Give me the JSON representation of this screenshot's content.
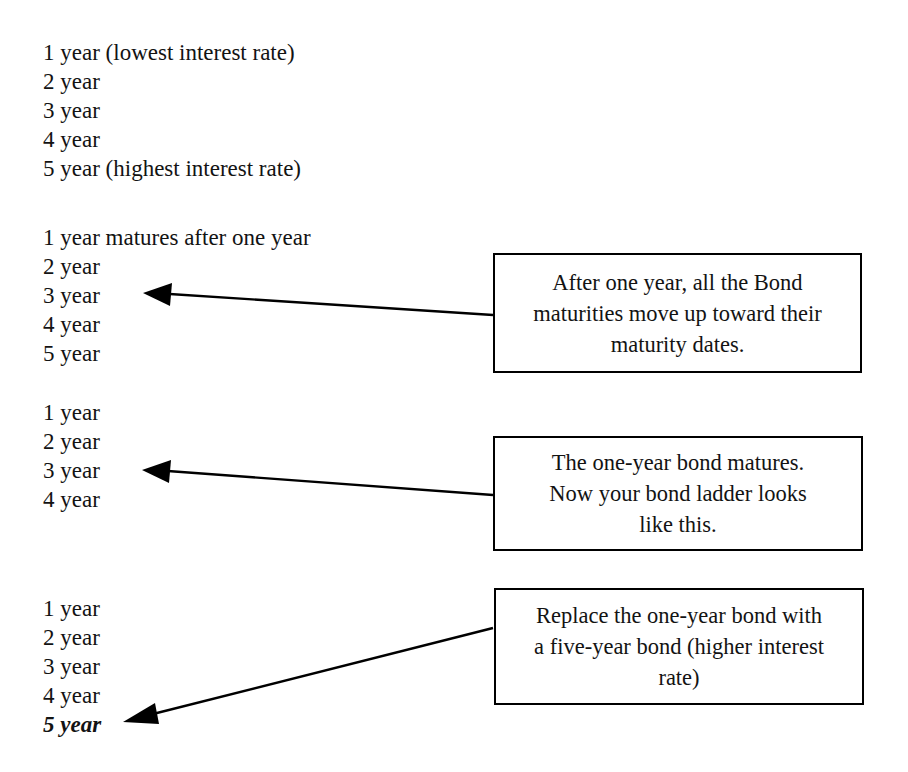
{
  "diagram": {
    "background_color": "#ffffff",
    "line_color": "#000000",
    "text_color": "#131313"
  },
  "ladders": [
    {
      "id": "initial-ladder",
      "rungs": [
        "1 year (lowest interest rate)",
        "2 year",
        "3 year",
        "4 year",
        "5 year (highest interest rate)"
      ]
    },
    {
      "id": "after-one-year-ladder",
      "rungs": [
        "1 year matures after one year",
        "2 year",
        "3 year",
        "4 year",
        "5 year"
      ]
    },
    {
      "id": "after-maturity-ladder",
      "rungs": [
        "1 year",
        "2 year",
        "3 year",
        "4 year"
      ]
    },
    {
      "id": "replaced-ladder",
      "rungs": [
        "1 year",
        "2 year",
        "3 year",
        "4 year",
        "5 year"
      ],
      "emphasis_index": 4
    }
  ],
  "callouts": [
    {
      "id": "callout-maturities-move-up",
      "lines": [
        "After one year, all the Bond",
        "maturities move up toward their",
        "maturity dates."
      ]
    },
    {
      "id": "callout-bond-matures",
      "lines": [
        "The one-year bond matures.",
        "Now your bond ladder looks",
        "like this."
      ]
    },
    {
      "id": "callout-replace-bond",
      "lines": [
        "Replace the one-year bond with",
        "a five-year bond (higher interest",
        "rate)"
      ]
    }
  ],
  "arrows": [
    {
      "id": "arrow-to-second-ladder",
      "points_to": "3 year"
    },
    {
      "id": "arrow-to-third-ladder",
      "points_to": "3 year"
    },
    {
      "id": "arrow-to-fourth-ladder",
      "points_to": "5 year"
    }
  ]
}
